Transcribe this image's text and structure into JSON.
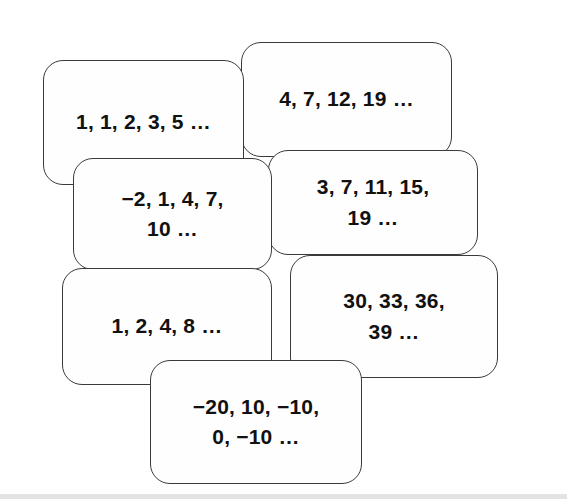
{
  "page": {
    "background_color": "#ffffff",
    "card_fill_color": "#fefefe",
    "card_border_color": "#3a3a3a",
    "text_color": "#111111"
  },
  "cards": [
    {
      "name": "sequence-card-fibonacci",
      "text": "1, 1, 2, 3, 5 …",
      "terms": [
        1,
        1,
        2,
        3,
        5
      ],
      "x": 43,
      "y": 60,
      "w": 201,
      "h": 125,
      "z": 3,
      "font_size": 21
    },
    {
      "name": "sequence-card-4-7-12-19",
      "text": "4, 7, 12, 19 …",
      "terms": [
        4,
        7,
        12,
        19
      ],
      "x": 241,
      "y": 42,
      "w": 211,
      "h": 115,
      "z": 2,
      "font_size": 21
    },
    {
      "name": "sequence-card-neg2-1-4-7-10",
      "text": "−2, 1, 4, 7,\n10 …",
      "terms": [
        -2,
        1,
        4,
        7,
        10
      ],
      "x": 73,
      "y": 158,
      "w": 199,
      "h": 112,
      "z": 5,
      "font_size": 21
    },
    {
      "name": "sequence-card-3-7-11-15-19",
      "text": "3, 7, 11, 15,\n19 …",
      "terms": [
        3,
        7,
        11,
        15,
        19
      ],
      "x": 268,
      "y": 150,
      "w": 210,
      "h": 105,
      "z": 4,
      "font_size": 21
    },
    {
      "name": "sequence-card-1-2-4-8",
      "text": "1, 2, 4, 8 …",
      "terms": [
        1,
        2,
        4,
        8
      ],
      "x": 62,
      "y": 268,
      "w": 210,
      "h": 117,
      "z": 6,
      "font_size": 21
    },
    {
      "name": "sequence-card-30-33-36-39",
      "text": "30, 33, 36,\n39 …",
      "terms": [
        30,
        33,
        36,
        39
      ],
      "x": 290,
      "y": 255,
      "w": 208,
      "h": 123,
      "z": 7,
      "font_size": 21
    },
    {
      "name": "sequence-card-neg20-10-neg10-0-neg10",
      "text": "−20, 10, −10,\n0, −10 …",
      "terms": [
        -20,
        10,
        -10,
        0,
        -10
      ],
      "x": 150,
      "y": 360,
      "w": 212,
      "h": 124,
      "z": 8,
      "font_size": 21
    }
  ],
  "bottom_rule": {
    "name": "bottom-divider",
    "y": 494,
    "color": "#e3e3e3"
  }
}
